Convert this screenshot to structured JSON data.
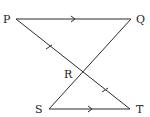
{
  "diagram": {
    "points": {
      "P": {
        "label": "P",
        "x": 16,
        "y": 19,
        "lx": 3,
        "ly": 23
      },
      "Q": {
        "label": "Q",
        "x": 131,
        "y": 19,
        "lx": 136,
        "ly": 23
      },
      "R": {
        "label": "R",
        "x": 82,
        "y": 72,
        "lx": 64,
        "ly": 78
      },
      "S": {
        "label": "S",
        "x": 49,
        "y": 109,
        "lx": 35,
        "ly": 113
      },
      "T": {
        "label": "T",
        "x": 130,
        "y": 109,
        "lx": 136,
        "ly": 113
      }
    },
    "segments": [
      "PQ",
      "PT",
      "QS",
      "ST"
    ],
    "parallel_marks": [
      "PQ",
      "ST"
    ],
    "equal_marks": [
      "PR",
      "RT"
    ],
    "colors": {
      "line": "#2b2b2b",
      "text": "#222222",
      "background": "#ffffff"
    }
  }
}
